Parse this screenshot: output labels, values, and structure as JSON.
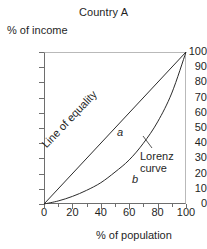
{
  "chart_data": {
    "type": "line",
    "title": "Country A",
    "xlabel": "% of population",
    "ylabel": "% of income",
    "xlim": [
      0,
      100
    ],
    "ylim": [
      0,
      100
    ],
    "grid": false,
    "legend_position": "none",
    "xticks": [
      "0",
      "20",
      "40",
      "60",
      "80",
      "100"
    ],
    "xtick_values": [
      0,
      20,
      40,
      60,
      80,
      100
    ],
    "xtick_minor_values": [
      10,
      30,
      50,
      70,
      90
    ],
    "yticks": [
      "0",
      "10",
      "20",
      "30",
      "40",
      "50",
      "60",
      "70",
      "80",
      "90",
      "100"
    ],
    "ytick_values": [
      0,
      10,
      20,
      30,
      40,
      50,
      60,
      70,
      80,
      90,
      100
    ],
    "series": [
      {
        "name": "Line of equality",
        "x": [
          0,
          100
        ],
        "values": [
          0,
          100
        ]
      },
      {
        "name": "Lorenz curve",
        "x": [
          0,
          10,
          20,
          30,
          40,
          50,
          60,
          70,
          80,
          90,
          100
        ],
        "values": [
          0,
          2,
          5,
          9,
          14,
          21,
          29,
          40,
          54,
          73,
          100
        ]
      }
    ],
    "annotations": [
      {
        "text": "Line of equality",
        "target": "line-of-equality"
      },
      {
        "text": "Lorenz\ncurve",
        "target": "lorenz-curve"
      },
      {
        "text": "a",
        "target": "region-between-curves"
      },
      {
        "text": "b",
        "target": "region-below-lorenz"
      }
    ],
    "colors": {
      "curve": "#2b2b2b",
      "axis": "#6e6e6e",
      "frame_light": "#b9b9b9",
      "text": "#1f1f1f",
      "background": "#ffffff"
    }
  },
  "labels": {
    "title": "Country A",
    "y_axis": "% of income",
    "x_axis": "% of population",
    "line_of_equality": "Line of equality",
    "lorenz_curve_line1": "Lorenz",
    "lorenz_curve_line2": "curve",
    "region_a": "a",
    "region_b": "b"
  }
}
